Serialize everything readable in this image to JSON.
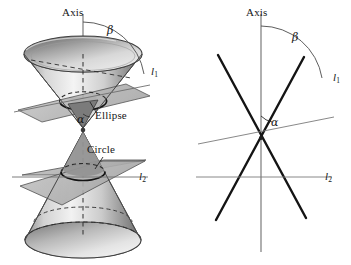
{
  "figure": {
    "panels": [
      {
        "id": "left",
        "kind": "3d-double-cone",
        "description": "Shaded double cone with a tilted cutting plane producing an ellipse and a horizontal cutting plane producing a circle",
        "labels": {
          "axis": "Axis",
          "beta": "β",
          "alpha": "α",
          "line1": "l",
          "line1_sub": "1",
          "line2": "l",
          "line2_sub": "2",
          "ellipse": "Ellipse",
          "circle": "Circle"
        }
      },
      {
        "id": "right",
        "kind": "2d-line-diagram",
        "description": "Two crossing straight lines representing the cone generators, a vertical axis, a tilted line l1 and a horizontal line l2",
        "labels": {
          "axis": "Axis",
          "beta": "β",
          "alpha": "α",
          "line1": "l",
          "line1_sub": "1",
          "line2": "l",
          "line2_sub": "2"
        }
      }
    ]
  },
  "colors": {
    "background": "#ffffff",
    "ink": "#171717",
    "axis_line": "#6e6e6e",
    "thin_line": "#7a7a7a",
    "thick_line": "#1a1a1a",
    "cone_light": "#f2f2f2",
    "cone_mid": "#bdbdbd",
    "cone_dark": "#8a8a8a",
    "cone_darkest": "#6a6a6a",
    "plane_fill": "#b8b8b8",
    "plane_stroke": "#4a4a4a",
    "dashed": "#3d3d3d"
  }
}
